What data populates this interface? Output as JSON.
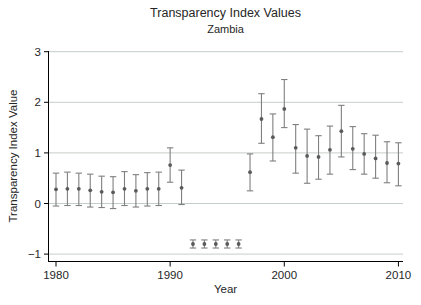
{
  "title": "Transparency Index Values",
  "subtitle": "Zambia",
  "colors": {
    "background": "#ffffff",
    "axis": "#000000",
    "grid": "#c6cec8",
    "error_bar": "#7f7f7f",
    "marker": "#5a5a5a",
    "text": "#262626"
  },
  "chart_data": {
    "type": "scatter",
    "title": "Transparency Index Values",
    "subtitle": "Zambia",
    "xlabel": "Year",
    "ylabel": "Transparency Index Value",
    "xlim": [
      1979.3,
      2010.5
    ],
    "ylim": [
      -1.16,
      3.02
    ],
    "x_ticks": [
      1980,
      1990,
      2000,
      2010
    ],
    "y_ticks": [
      3,
      2,
      1,
      0,
      -1
    ],
    "grid": true,
    "legend": "none",
    "series": [
      {
        "name": "Transparency Index Value with confidence interval",
        "marker": "circle",
        "points": [
          {
            "year": 1980,
            "value": 0.28,
            "lo": -0.05,
            "hi": 0.6
          },
          {
            "year": 1981,
            "value": 0.29,
            "lo": -0.04,
            "hi": 0.62
          },
          {
            "year": 1982,
            "value": 0.29,
            "lo": -0.04,
            "hi": 0.6
          },
          {
            "year": 1983,
            "value": 0.26,
            "lo": -0.07,
            "hi": 0.58
          },
          {
            "year": 1984,
            "value": 0.23,
            "lo": -0.08,
            "hi": 0.54
          },
          {
            "year": 1985,
            "value": 0.22,
            "lo": -0.1,
            "hi": 0.53
          },
          {
            "year": 1986,
            "value": 0.29,
            "lo": -0.04,
            "hi": 0.63
          },
          {
            "year": 1987,
            "value": 0.25,
            "lo": -0.07,
            "hi": 0.57
          },
          {
            "year": 1988,
            "value": 0.29,
            "lo": -0.05,
            "hi": 0.61
          },
          {
            "year": 1989,
            "value": 0.29,
            "lo": -0.04,
            "hi": 0.62
          },
          {
            "year": 1990,
            "value": 0.76,
            "lo": 0.42,
            "hi": 1.1
          },
          {
            "year": 1991,
            "value": 0.31,
            "lo": -0.02,
            "hi": 0.66
          },
          {
            "year": 1992,
            "value": -0.8,
            "lo": -0.88,
            "hi": -0.72
          },
          {
            "year": 1993,
            "value": -0.8,
            "lo": -0.88,
            "hi": -0.72
          },
          {
            "year": 1994,
            "value": -0.8,
            "lo": -0.88,
            "hi": -0.72
          },
          {
            "year": 1995,
            "value": -0.8,
            "lo": -0.88,
            "hi": -0.72
          },
          {
            "year": 1996,
            "value": -0.8,
            "lo": -0.88,
            "hi": -0.72
          },
          {
            "year": 1997,
            "value": 0.62,
            "lo": 0.25,
            "hi": 0.98
          },
          {
            "year": 1998,
            "value": 1.67,
            "lo": 1.19,
            "hi": 2.17
          },
          {
            "year": 1999,
            "value": 1.31,
            "lo": 0.84,
            "hi": 1.77
          },
          {
            "year": 2000,
            "value": 1.87,
            "lo": 1.5,
            "hi": 2.45
          },
          {
            "year": 2001,
            "value": 1.1,
            "lo": 0.6,
            "hi": 1.56
          },
          {
            "year": 2002,
            "value": 0.94,
            "lo": 0.4,
            "hi": 1.47
          },
          {
            "year": 2003,
            "value": 0.92,
            "lo": 0.48,
            "hi": 1.34
          },
          {
            "year": 2004,
            "value": 1.06,
            "lo": 0.58,
            "hi": 1.53
          },
          {
            "year": 2005,
            "value": 1.43,
            "lo": 0.92,
            "hi": 1.94
          },
          {
            "year": 2006,
            "value": 1.08,
            "lo": 0.67,
            "hi": 1.52
          },
          {
            "year": 2007,
            "value": 0.98,
            "lo": 0.58,
            "hi": 1.38
          },
          {
            "year": 2008,
            "value": 0.89,
            "lo": 0.5,
            "hi": 1.35
          },
          {
            "year": 2009,
            "value": 0.8,
            "lo": 0.41,
            "hi": 1.22
          },
          {
            "year": 2010,
            "value": 0.79,
            "lo": 0.35,
            "hi": 1.2
          }
        ]
      }
    ]
  }
}
